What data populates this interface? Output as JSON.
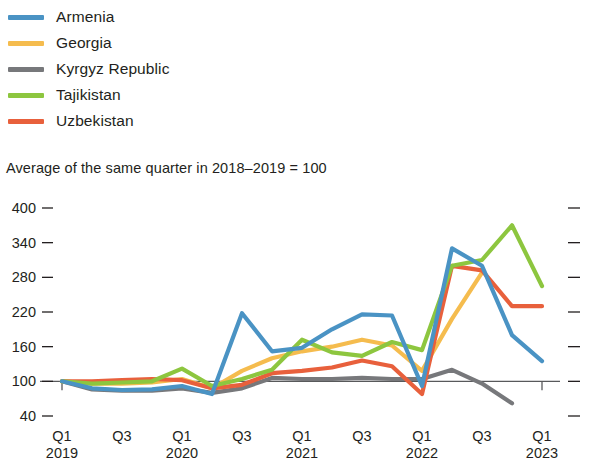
{
  "subtitle": "Average of the same quarter in 2018–2019 = 100",
  "legend": {
    "items": [
      {
        "label": "Armenia",
        "color": "#4a93c4"
      },
      {
        "label": "Georgia",
        "color": "#f5bc4e"
      },
      {
        "label": "Kyrgyz Republic",
        "color": "#77787b"
      },
      {
        "label": "Tajikistan",
        "color": "#8dc63f"
      },
      {
        "label": "Uzbekistan",
        "color": "#e8603c"
      }
    ]
  },
  "axes": {
    "y_ticks": [
      400,
      340,
      280,
      220,
      160,
      100,
      40
    ],
    "y_tick_labels": [
      "400",
      "340",
      "280",
      "220",
      "160",
      "100",
      "40"
    ],
    "x_tick_labels": [
      {
        "quarter": "Q1",
        "year": "2019"
      },
      {
        "quarter": "Q3",
        "year": ""
      },
      {
        "quarter": "Q1",
        "year": "2020"
      },
      {
        "quarter": "Q3",
        "year": ""
      },
      {
        "quarter": "Q1",
        "year": "2021"
      },
      {
        "quarter": "Q3",
        "year": ""
      },
      {
        "quarter": "Q1",
        "year": "2022"
      },
      {
        "quarter": "Q3",
        "year": ""
      },
      {
        "quarter": "Q1",
        "year": "2023"
      }
    ],
    "baseline_value": 100
  },
  "chart_data": {
    "type": "line",
    "title": "",
    "subtitle": "Average of the same quarter in 2018–2019 = 100",
    "xlabel": "",
    "ylabel": "",
    "ylim": [
      40,
      400
    ],
    "grid": false,
    "legend_position": "top-left",
    "x": [
      "Q1 2019",
      "Q2 2019",
      "Q3 2019",
      "Q4 2019",
      "Q1 2020",
      "Q2 2020",
      "Q3 2020",
      "Q4 2020",
      "Q1 2021",
      "Q2 2021",
      "Q3 2021",
      "Q4 2021",
      "Q1 2022",
      "Q2 2022",
      "Q3 2022",
      "Q4 2022",
      "Q1 2023"
    ],
    "series": [
      {
        "name": "Armenia",
        "color": "#4a93c4",
        "values": [
          100,
          88,
          85,
          86,
          92,
          78,
          218,
          152,
          158,
          190,
          216,
          214,
          92,
          330,
          300,
          180,
          135
        ]
      },
      {
        "name": "Georgia",
        "color": "#f5bc4e",
        "values": [
          100,
          96,
          96,
          98,
          104,
          88,
          118,
          140,
          152,
          160,
          172,
          162,
          118,
          208,
          288,
          null,
          null
        ]
      },
      {
        "name": "Kyrgyz Republic",
        "color": "#77787b",
        "values": [
          100,
          86,
          84,
          84,
          88,
          80,
          88,
          106,
          104,
          104,
          106,
          104,
          104,
          120,
          96,
          62,
          null
        ]
      },
      {
        "name": "Tajikistan",
        "color": "#8dc63f",
        "values": [
          100,
          96,
          98,
          100,
          122,
          92,
          104,
          120,
          172,
          150,
          144,
          168,
          154,
          300,
          310,
          370,
          265
        ]
      },
      {
        "name": "Uzbekistan",
        "color": "#e8603c",
        "values": [
          100,
          100,
          102,
          104,
          102,
          88,
          94,
          114,
          118,
          124,
          136,
          126,
          78,
          300,
          292,
          230,
          230
        ]
      }
    ]
  }
}
